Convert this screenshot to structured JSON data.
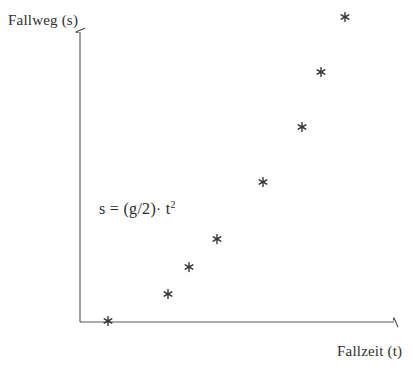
{
  "figure": {
    "width": 415,
    "height": 376,
    "background": "#ffffff",
    "ink_color": "#2b2b2b",
    "axis_color": "#555555"
  },
  "labels": {
    "y_axis": "Fallweg (s)",
    "x_axis": "Fallzeit (t)",
    "formula_lhs": "s = (g/2)",
    "formula_dot": "·",
    "formula_base": "t",
    "formula_exponent": "2",
    "formula_full": "s = (g/2) · t²"
  },
  "axes": {
    "origin_x": 80,
    "origin_y": 322,
    "y_top": 28,
    "x_right": 399,
    "arrowheads": true,
    "ticks": false,
    "gridlines": false
  },
  "chart_data": {
    "type": "scatter",
    "title": "",
    "subtitle": "",
    "xlabel": "Fallzeit (t)",
    "ylabel": "Fallweg (s)",
    "annotations": [
      "s = (g/2) · t²"
    ],
    "legend": [],
    "legend_position": "none",
    "grid": false,
    "tick_labels_x": [],
    "tick_labels_y": [],
    "xlim": [
      0,
      8
    ],
    "ylim": [
      0,
      64
    ],
    "marker": "asterisk",
    "marker_color": "#3a3a3a",
    "series": [
      {
        "name": "Freier Fall",
        "x": [
          0,
          1,
          2,
          3,
          4,
          5,
          6,
          7
        ],
        "y": [
          0,
          1,
          4,
          9,
          16,
          25,
          36,
          49
        ],
        "pixels": [
          {
            "px": 108,
            "py": 321
          },
          {
            "px": 168,
            "py": 294
          },
          {
            "px": 189,
            "py": 267
          },
          {
            "px": 217,
            "py": 239
          },
          {
            "px": 263,
            "py": 182
          },
          {
            "px": 302,
            "py": 127
          },
          {
            "px": 321,
            "py": 72
          },
          {
            "px": 345,
            "py": 17
          }
        ]
      }
    ]
  }
}
